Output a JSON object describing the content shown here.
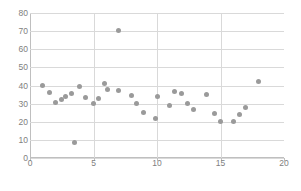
{
  "chart_data": {
    "type": "scatter",
    "title": "",
    "subtitle": "",
    "xlabel": "",
    "ylabel": "",
    "xlim": [
      0,
      20
    ],
    "ylim": [
      0,
      80
    ],
    "xticks": [
      0,
      5,
      10,
      15,
      20
    ],
    "yticks": [
      0,
      10,
      20,
      30,
      40,
      50,
      60,
      70,
      80
    ],
    "grid": {
      "horizontal": true,
      "vertical": true,
      "color": "#d9d9d9"
    },
    "legend": {
      "visible": false,
      "position": "none",
      "entries": []
    },
    "marker": {
      "shape": "circle",
      "color": "#9a9a9a",
      "size": 5
    },
    "series": [
      {
        "name": "series-1",
        "points": [
          {
            "x": 1.0,
            "y": 40.1
          },
          {
            "x": 1.5,
            "y": 35.9
          },
          {
            "x": 2.0,
            "y": 30.5
          },
          {
            "x": 2.5,
            "y": 32.2
          },
          {
            "x": 2.8,
            "y": 33.9
          },
          {
            "x": 3.3,
            "y": 35.6
          },
          {
            "x": 3.5,
            "y": 8.4
          },
          {
            "x": 3.9,
            "y": 39.5
          },
          {
            "x": 4.4,
            "y": 33.2
          },
          {
            "x": 5.0,
            "y": 30.2
          },
          {
            "x": 5.4,
            "y": 33.1
          },
          {
            "x": 5.9,
            "y": 41.0
          },
          {
            "x": 6.1,
            "y": 37.6
          },
          {
            "x": 7.0,
            "y": 70.2
          },
          {
            "x": 7.0,
            "y": 37.4
          },
          {
            "x": 8.0,
            "y": 34.7
          },
          {
            "x": 8.4,
            "y": 30.1
          },
          {
            "x": 8.9,
            "y": 24.9
          },
          {
            "x": 9.9,
            "y": 21.9
          },
          {
            "x": 10.0,
            "y": 33.7
          },
          {
            "x": 11.0,
            "y": 29.2
          },
          {
            "x": 11.4,
            "y": 36.7
          },
          {
            "x": 11.9,
            "y": 35.8
          },
          {
            "x": 12.4,
            "y": 29.8
          },
          {
            "x": 12.9,
            "y": 26.7
          },
          {
            "x": 13.9,
            "y": 34.9
          },
          {
            "x": 14.5,
            "y": 24.3
          },
          {
            "x": 15.0,
            "y": 20.3
          },
          {
            "x": 16.0,
            "y": 20.2
          },
          {
            "x": 16.5,
            "y": 24.1
          },
          {
            "x": 17.0,
            "y": 27.8
          },
          {
            "x": 18.0,
            "y": 42.0
          }
        ]
      }
    ]
  }
}
